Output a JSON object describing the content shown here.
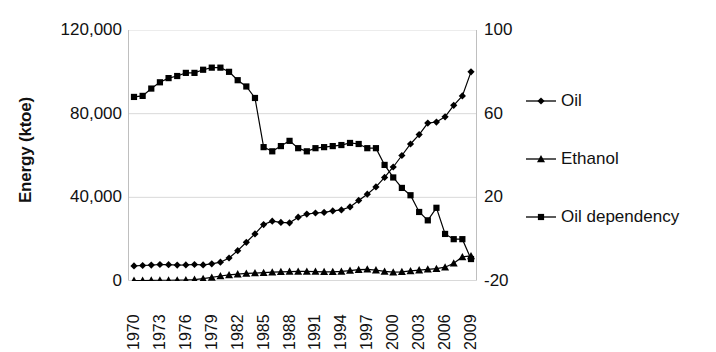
{
  "chart_data": {
    "type": "line",
    "title": "",
    "xlabel": "",
    "ylabel": "Energy (ktoe)",
    "ylabel_right": "",
    "grid": true,
    "legend_position": "right",
    "x": [
      1970,
      1971,
      1972,
      1973,
      1974,
      1975,
      1976,
      1977,
      1978,
      1979,
      1980,
      1981,
      1982,
      1983,
      1984,
      1985,
      1986,
      1987,
      1988,
      1989,
      1990,
      1991,
      1992,
      1993,
      1994,
      1995,
      1996,
      1997,
      1998,
      1999,
      2000,
      2001,
      2002,
      2003,
      2004,
      2005,
      2006,
      2007,
      2008,
      2009
    ],
    "xtick_labels": [
      "1970",
      "1973",
      "1976",
      "1979",
      "1982",
      "1985",
      "1988",
      "1991",
      "1994",
      "1997",
      "2000",
      "2003",
      "2006",
      "2009"
    ],
    "xtick_values": [
      1970,
      1973,
      1976,
      1979,
      1982,
      1985,
      1988,
      1991,
      1994,
      1997,
      2000,
      2003,
      2006,
      2009
    ],
    "ylim": [
      0,
      120000
    ],
    "ytick_labels": [
      "0",
      "40,000",
      "80,000",
      "120,000"
    ],
    "ytick_values": [
      0,
      40000,
      80000,
      120000
    ],
    "ylim_right": [
      -20,
      100
    ],
    "ytick_labels_right": [
      "-20",
      "20",
      "60",
      "100"
    ],
    "ytick_values_right": [
      -20,
      20,
      60,
      100
    ],
    "series": [
      {
        "name": "Oil",
        "marker": "diamond",
        "axis": "left",
        "color": "#000000",
        "values": [
          7200,
          7400,
          7600,
          7900,
          7800,
          7600,
          7700,
          7900,
          7700,
          8200,
          9000,
          11000,
          14500,
          18500,
          22500,
          27000,
          28600,
          28000,
          27800,
          30500,
          32000,
          32500,
          32800,
          33500,
          34000,
          35400,
          38500,
          41500,
          45000,
          49500,
          54500,
          60000,
          65500,
          70000,
          75500,
          76000,
          78500,
          84000,
          88500,
          100000
        ]
      },
      {
        "name": "Ethanol",
        "marker": "triangle",
        "axis": "left",
        "color": "#000000",
        "values": [
          200,
          250,
          300,
          350,
          350,
          400,
          500,
          700,
          1100,
          1700,
          2400,
          2900,
          3300,
          3600,
          3800,
          4000,
          4200,
          4400,
          4500,
          4600,
          4600,
          4500,
          4400,
          4400,
          4600,
          5000,
          5400,
          5600,
          5200,
          4600,
          4200,
          4400,
          4800,
          5200,
          5600,
          5900,
          6600,
          8500,
          11500,
          12000
        ]
      },
      {
        "name": "Oil dependency",
        "marker": "square",
        "axis": "right",
        "color": "#000000",
        "values": [
          68,
          68.5,
          72,
          75,
          77,
          78,
          79.5,
          79.5,
          81,
          82,
          82,
          80,
          76,
          73,
          67.5,
          44,
          42,
          44.5,
          47,
          43.5,
          42,
          43.5,
          44,
          44.5,
          45,
          46,
          45.5,
          43.5,
          43.5,
          35.5,
          29.5,
          24.5,
          21,
          13,
          9,
          15,
          2.5,
          0,
          0,
          -9.5
        ]
      }
    ]
  },
  "legend": {
    "items": [
      {
        "label": "Oil",
        "marker": "diamond"
      },
      {
        "label": "Ethanol",
        "marker": "triangle"
      },
      {
        "label": "Oil dependency",
        "marker": "square"
      }
    ]
  },
  "colors": {
    "series": "#000000",
    "grid": "#d9d9d9",
    "axis": "#bfbfbf",
    "text": "#111111",
    "background": "#ffffff"
  }
}
